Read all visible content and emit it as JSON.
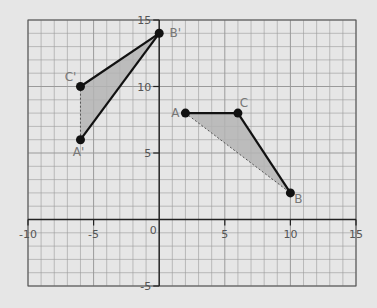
{
  "chart_data": {
    "type": "scatter",
    "title": "",
    "xlabel": "",
    "ylabel": "",
    "xlim": [
      -10,
      15
    ],
    "ylim": [
      -5,
      15
    ],
    "grid": true,
    "grid_minor_step": 1,
    "x_ticks": [
      -10,
      -5,
      0,
      5,
      10,
      15
    ],
    "y_ticks": [
      -5,
      5,
      10,
      15
    ],
    "x_tick_labels": [
      "-10",
      "-5",
      "0",
      "5",
      "10",
      "15"
    ],
    "y_tick_labels": [
      "-5",
      "5",
      "10",
      "15"
    ],
    "shapes": [
      {
        "name": "Triangle ABC",
        "vertices": [
          {
            "label": "A",
            "x": 2,
            "y": 8
          },
          {
            "label": "B",
            "x": 10,
            "y": 2
          },
          {
            "label": "C",
            "x": 6,
            "y": 8
          }
        ],
        "solid_edges": [
          [
            "A",
            "C"
          ],
          [
            "C",
            "B"
          ]
        ],
        "dashed_edges": [
          [
            "A",
            "B"
          ]
        ]
      },
      {
        "name": "Triangle A'B'C'",
        "vertices": [
          {
            "label": "A'",
            "x": -6,
            "y": 6
          },
          {
            "label": "B'",
            "x": 0,
            "y": 14
          },
          {
            "label": "C'",
            "x": -6,
            "y": 10
          }
        ],
        "solid_edges": [
          [
            "A'",
            "B'"
          ],
          [
            "C'",
            "B'"
          ]
        ],
        "dashed_edges": [
          [
            "A'",
            "C'"
          ]
        ]
      }
    ]
  },
  "colors": {
    "background": "#e6e6e6",
    "grid": "#9a9a9a",
    "axis": "#222222",
    "fill": "#b4b4b4",
    "edge": "#111111",
    "label": "#777777"
  }
}
